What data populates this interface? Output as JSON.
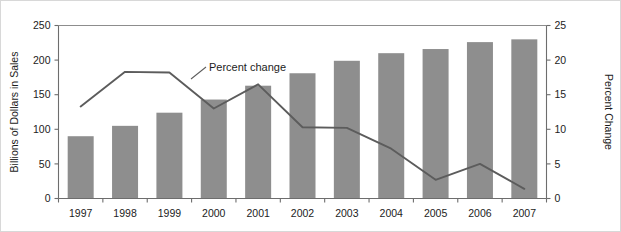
{
  "chart_data": {
    "type": "bar",
    "title": "",
    "subtitle": "",
    "xlabel": "",
    "ylabel": "Billions of Dollars in Sales",
    "y2label": "Percent Change",
    "categories": [
      "1997",
      "1998",
      "1999",
      "2000",
      "2001",
      "2002",
      "2003",
      "2004",
      "2005",
      "2006",
      "2007"
    ],
    "ylim": [
      0,
      250
    ],
    "y2lim": [
      0,
      25
    ],
    "yticks": [
      "0",
      "50",
      "100",
      "150",
      "200",
      "250"
    ],
    "ytick_values": [
      0,
      50,
      100,
      150,
      200,
      250
    ],
    "y2ticks": [
      "0",
      "5",
      "10",
      "15",
      "20",
      "25"
    ],
    "y2tick_values": [
      0,
      5,
      10,
      15,
      20,
      25
    ],
    "grid": false,
    "legend": "none",
    "series": [
      {
        "name": "Billions of Dollars in Sales",
        "type": "bar",
        "axis": "left",
        "color": "#8e8e8e",
        "values": [
          90,
          105,
          124,
          143,
          163,
          181,
          199,
          210,
          216,
          226,
          230
        ]
      },
      {
        "name": "Percent change",
        "type": "line",
        "axis": "right",
        "color": "#5c5c5c",
        "values": [
          13.3,
          18.3,
          18.2,
          13.0,
          16.5,
          10.3,
          10.2,
          7.2,
          2.7,
          5.0,
          1.4
        ]
      }
    ],
    "annotations": [
      {
        "text": "Percent change",
        "attached_to": "Percent change",
        "near_category": "2000"
      }
    ]
  }
}
